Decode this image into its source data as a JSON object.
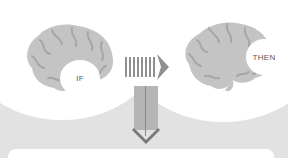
{
  "diagram": {
    "type": "if-then flow",
    "left_node": {
      "label": "IF",
      "icon": "brain-icon"
    },
    "right_node": {
      "label": "THEN",
      "icon": "brain-icon"
    },
    "connector_horizontal": {
      "icon": "striped-right-arrow-icon",
      "direction": "right"
    },
    "connector_vertical": {
      "icon": "down-arrow-icon",
      "direction": "down"
    },
    "result_box": {
      "label": ""
    }
  },
  "colors": {
    "background": "#e2e2e2",
    "halo": "#ffffff",
    "brain_fill": "#c4c4c4",
    "brain_folds": "#a6a6a6",
    "arrow": "#8f8f8f",
    "arrow_dark": "#7a7a7a",
    "label_text": "#555555"
  }
}
